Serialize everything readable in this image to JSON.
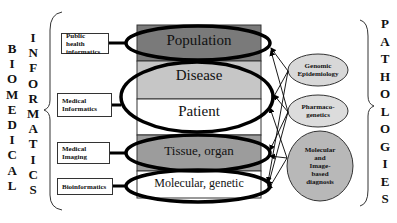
{
  "left_title_1": [
    "B",
    "I",
    "O",
    "M",
    "E",
    "D",
    "I",
    "C",
    "A",
    "L"
  ],
  "left_title_2": [
    "I",
    "N",
    "F",
    "O",
    "R",
    "M",
    "A",
    "T",
    "I",
    "C",
    "S"
  ],
  "right_title": [
    "P",
    "A",
    "T",
    "H",
    "O",
    "L",
    "O",
    "G",
    "I",
    "E",
    "S"
  ],
  "left_boxes": [
    {
      "line1": "Public health",
      "line2": "informatics"
    },
    {
      "line1": "Medical",
      "line2": "Informatics"
    },
    {
      "line1": "Medical",
      "line2": "Imaging"
    },
    {
      "line1": "Bioinformatics",
      "line2": ""
    }
  ],
  "levels": [
    {
      "label": "Population",
      "color": "#7a7a7a"
    },
    {
      "label": "Disease",
      "color": "#c8c8c8"
    },
    {
      "label": "Patient",
      "color": "#ffffff"
    },
    {
      "label": "Tissue, organ",
      "color": "#9a9a9a"
    },
    {
      "label": "Molecular, genetic",
      "color": "#ffffff"
    }
  ],
  "right_ellipses": [
    {
      "line1": "Genomic",
      "line2": "Epidemiology"
    },
    {
      "line1": "Pharmaco-",
      "line2": "genetics"
    },
    {
      "lines": [
        "Molecular",
        "and",
        "Image-",
        "based",
        "diagnosis"
      ]
    }
  ]
}
